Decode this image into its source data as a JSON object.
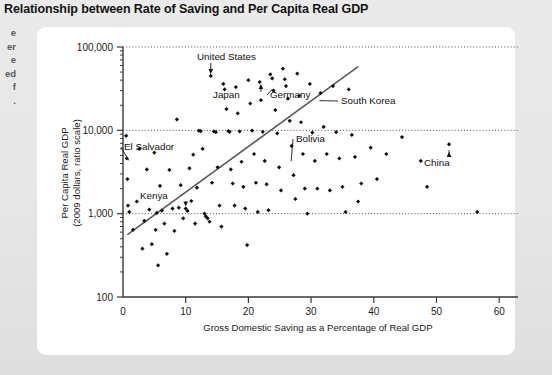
{
  "figure": {
    "title": "Relationship between Rate of Saving and Per Capita Real GDP"
  },
  "margin_gutter": {
    "fragments": [
      "e",
      "er",
      "e",
      "ed",
      "f",
      "."
    ]
  },
  "chart_data": {
    "type": "scatter",
    "title": "Relationship between Rate of Saving and Per Capita Real GDP",
    "xlabel": "Gross Domestic Saving as a Percentage of Real GDP",
    "ylabel": "Per Capita Real GDP\n(2009 dollars, ratio scale)",
    "ylabel_line1": "Per Capita Real GDP",
    "ylabel_line2": "(2009 dollars, ratio scale)",
    "yscale": "log",
    "xscale": "linear",
    "xlim": [
      0,
      63
    ],
    "ylim": [
      100,
      100000
    ],
    "xticks": [
      0,
      10,
      20,
      30,
      40,
      50,
      60
    ],
    "xtick_labels": [
      "0",
      "10",
      "20",
      "30",
      "40",
      "50",
      "60"
    ],
    "yticks": [
      100,
      1000,
      10000,
      100000
    ],
    "ytick_labels": [
      "100",
      "1,000",
      "10,000",
      "100,000"
    ],
    "grid": "horizontal-dotted-at-decades",
    "legend": "none",
    "trend_line": {
      "label": "fitted trend",
      "x0": 0.7,
      "y0": 560,
      "x1": 37.5,
      "y1": 58000
    },
    "series": [
      {
        "name": "Countries",
        "marker": "diamond",
        "color": "#111111",
        "points": [
          [
            0.5,
            8600
          ],
          [
            0.6,
            4600
          ],
          [
            0.7,
            2600
          ],
          [
            0.8,
            1250
          ],
          [
            1.0,
            1050
          ],
          [
            1.6,
            640
          ],
          [
            2.2,
            1400
          ],
          [
            2.6,
            6000
          ],
          [
            3.1,
            380
          ],
          [
            3.4,
            820
          ],
          [
            3.8,
            3400
          ],
          [
            4.2,
            1120
          ],
          [
            4.6,
            430
          ],
          [
            5.0,
            5400
          ],
          [
            5.2,
            640
          ],
          [
            5.4,
            1020
          ],
          [
            5.6,
            240
          ],
          [
            5.9,
            2150
          ],
          [
            6.2,
            1090
          ],
          [
            6.6,
            760
          ],
          [
            7.0,
            330
          ],
          [
            7.4,
            3350
          ],
          [
            7.9,
            1150
          ],
          [
            8.2,
            620
          ],
          [
            8.6,
            13500
          ],
          [
            8.9,
            1180
          ],
          [
            9.2,
            2200
          ],
          [
            9.6,
            880
          ],
          [
            10.0,
            1150
          ],
          [
            10.3,
            1080
          ],
          [
            10.6,
            3500
          ],
          [
            10.9,
            1420
          ],
          [
            11.2,
            5100
          ],
          [
            11.5,
            760
          ],
          [
            11.8,
            2050
          ],
          [
            12.1,
            9900
          ],
          [
            12.4,
            9800
          ],
          [
            12.7,
            6000
          ],
          [
            13.0,
            1000
          ],
          [
            13.2,
            930
          ],
          [
            13.5,
            880
          ],
          [
            13.8,
            800
          ],
          [
            14.0,
            45000
          ],
          [
            14.2,
            2350
          ],
          [
            14.5,
            9700
          ],
          [
            14.8,
            9500
          ],
          [
            15.1,
            3600
          ],
          [
            15.4,
            1250
          ],
          [
            15.7,
            700
          ],
          [
            16.0,
            36000
          ],
          [
            16.2,
            31000
          ],
          [
            16.5,
            18000
          ],
          [
            16.8,
            9800
          ],
          [
            17.0,
            9600
          ],
          [
            17.2,
            3400
          ],
          [
            17.5,
            2300
          ],
          [
            17.8,
            1250
          ],
          [
            18.0,
            33000
          ],
          [
            18.3,
            16000
          ],
          [
            18.6,
            9700
          ],
          [
            18.9,
            4200
          ],
          [
            19.2,
            2100
          ],
          [
            19.5,
            1150
          ],
          [
            19.8,
            420
          ],
          [
            20.0,
            40000
          ],
          [
            20.3,
            21000
          ],
          [
            20.6,
            9900
          ],
          [
            20.9,
            5200
          ],
          [
            21.2,
            2350
          ],
          [
            21.5,
            1050
          ],
          [
            21.8,
            38000
          ],
          [
            22.0,
            23000
          ],
          [
            22.3,
            9600
          ],
          [
            22.6,
            4300
          ],
          [
            22.9,
            2250
          ],
          [
            23.2,
            1100
          ],
          [
            23.5,
            47000
          ],
          [
            23.8,
            42000
          ],
          [
            24.0,
            30000
          ],
          [
            24.3,
            17500
          ],
          [
            24.6,
            9200
          ],
          [
            24.9,
            3600
          ],
          [
            25.2,
            1900
          ],
          [
            25.5,
            55000
          ],
          [
            25.8,
            41000
          ],
          [
            26.0,
            34000
          ],
          [
            26.3,
            24000
          ],
          [
            26.6,
            13000
          ],
          [
            26.9,
            6500
          ],
          [
            27.2,
            2900
          ],
          [
            27.5,
            1500
          ],
          [
            27.8,
            48000
          ],
          [
            28.1,
            26000
          ],
          [
            28.4,
            12500
          ],
          [
            28.7,
            5200
          ],
          [
            29.0,
            2000
          ],
          [
            29.4,
            1000
          ],
          [
            29.8,
            36000
          ],
          [
            30.2,
            9400
          ],
          [
            30.6,
            4300
          ],
          [
            31.0,
            2000
          ],
          [
            31.5,
            28000
          ],
          [
            32.0,
            11000
          ],
          [
            32.5,
            5200
          ],
          [
            33.0,
            1900
          ],
          [
            33.5,
            34000
          ],
          [
            34.0,
            9500
          ],
          [
            34.5,
            4600
          ],
          [
            35.0,
            2100
          ],
          [
            35.5,
            1050
          ],
          [
            36.0,
            31000
          ],
          [
            36.5,
            8800
          ],
          [
            37.0,
            4800
          ],
          [
            37.5,
            1400
          ],
          [
            38.0,
            2300
          ],
          [
            39.5,
            6200
          ],
          [
            40.5,
            2600
          ],
          [
            42.0,
            5200
          ],
          [
            44.5,
            8300
          ],
          [
            47.5,
            4300
          ],
          [
            48.5,
            2100
          ],
          [
            52.0,
            6800
          ],
          [
            56.5,
            1050
          ]
        ]
      }
    ],
    "annotations": [
      {
        "label": "United States",
        "type": "arrow-down",
        "point_x": 14.0,
        "point_y": 45000
      },
      {
        "label": "Japan",
        "type": "arrow-up",
        "point_x": 22.0,
        "point_y": 34000
      },
      {
        "label": "Germany",
        "type": "leader-line",
        "point_x": 23.5,
        "point_y": 33000
      },
      {
        "label": "South Korea",
        "type": "leader-line",
        "point_x": 31.0,
        "point_y": 24000
      },
      {
        "label": "El Salvador",
        "type": "leader-line",
        "point_x": 0.6,
        "point_y": 4600
      },
      {
        "label": "Kenya",
        "type": "arrow-down",
        "point_x": 10.0,
        "point_y": 1150
      },
      {
        "label": "Bolivia",
        "type": "leader-line",
        "point_x": 26.5,
        "point_y": 4500
      },
      {
        "label": "China",
        "type": "arrow-up",
        "point_x": 52.0,
        "point_y": 6800
      }
    ]
  }
}
